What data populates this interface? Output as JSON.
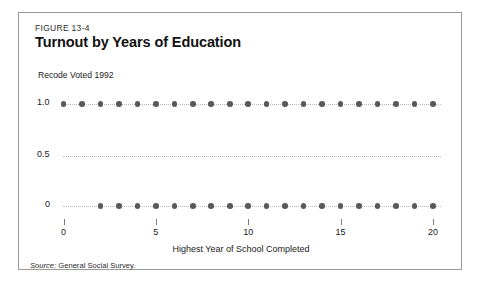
{
  "figure": {
    "number": "FIGURE 13-4",
    "title": "Turnout by Years of Education",
    "source_label": "Source:",
    "source_text": "General Social Survey."
  },
  "chart_data": {
    "type": "scatter",
    "title": "Turnout by Years of Education",
    "xlabel": "Highest Year of School Completed",
    "ylabel": "Recode Voted 1992",
    "xlim": [
      -0.6,
      21.0
    ],
    "ylim": [
      -0.12,
      1.15
    ],
    "xticks": [
      0,
      5,
      10,
      15,
      20
    ],
    "xtick_labels": [
      "0",
      "5",
      "10",
      "15",
      "20"
    ],
    "yticks": [
      0,
      0.5,
      1.0
    ],
    "ytick_labels": [
      "0",
      "0.5",
      "1.0"
    ],
    "grid": "horizontal-dotted",
    "legend": "none",
    "marker_color": "#595959",
    "gridline_color": "#b9b9b9",
    "series": [
      {
        "name": "Voted (1.0)",
        "y": 1.0,
        "x": [
          0,
          1,
          2,
          3,
          4,
          5,
          6,
          7,
          8,
          9,
          10,
          11,
          12,
          13,
          14,
          15,
          16,
          17,
          18,
          19,
          20
        ]
      },
      {
        "name": "Did not vote (0)",
        "y": 0.0,
        "x": [
          2,
          3,
          4,
          5,
          6,
          7,
          8,
          9,
          10,
          11,
          12,
          13,
          14,
          15,
          16,
          17,
          18,
          19,
          20
        ]
      }
    ]
  }
}
